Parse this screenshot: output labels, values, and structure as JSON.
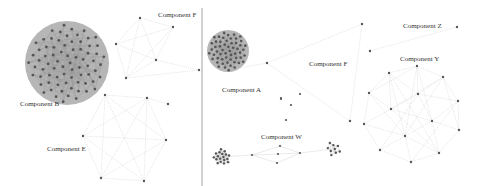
{
  "figure": {
    "width": 481,
    "height": 186,
    "divider_x": 202,
    "colors": {
      "node": "#555555",
      "edge": "#cfcfcf",
      "dense_fill": "#a9a9a9",
      "label": "#333333",
      "divider": "#8a8a8a"
    }
  },
  "panels": [
    {
      "id": "left",
      "components": [
        {
          "label": "Component B",
          "label_pos": [
            20,
            106
          ],
          "type": "dense-disk",
          "center": [
            67,
            63
          ],
          "radius": 42,
          "node_count": 75
        },
        {
          "label": "Component F",
          "label_pos": [
            158,
            17
          ],
          "type": "graph",
          "nodes": [
            [
              140,
              18
            ],
            [
              173,
              27
            ],
            [
              116,
              44
            ],
            [
              156,
              60
            ],
            [
              126,
              78
            ],
            [
              199,
              70
            ]
          ],
          "edges": [
            [
              0,
              1
            ],
            [
              0,
              2
            ],
            [
              0,
              3
            ],
            [
              0,
              4
            ],
            [
              1,
              2
            ],
            [
              1,
              3
            ],
            [
              1,
              4
            ],
            [
              2,
              3
            ],
            [
              2,
              4
            ],
            [
              3,
              4
            ],
            [
              3,
              5
            ],
            [
              4,
              5
            ]
          ]
        },
        {
          "label": "Component E",
          "label_pos": [
            47,
            149
          ],
          "type": "graph",
          "nodes": [
            [
              105,
              95
            ],
            [
              147,
              98
            ],
            [
              168,
              104
            ],
            [
              83,
              136
            ],
            [
              166,
              140
            ],
            [
              101,
              178
            ],
            [
              144,
              181
            ]
          ],
          "edges": [
            [
              0,
              1
            ],
            [
              0,
              3
            ],
            [
              0,
              4
            ],
            [
              0,
              5
            ],
            [
              0,
              6
            ],
            [
              1,
              3
            ],
            [
              1,
              4
            ],
            [
              1,
              5
            ],
            [
              1,
              6
            ],
            [
              3,
              4
            ],
            [
              3,
              5
            ],
            [
              3,
              6
            ],
            [
              4,
              5
            ],
            [
              4,
              6
            ],
            [
              5,
              6
            ],
            [
              1,
              2
            ]
          ]
        }
      ]
    },
    {
      "id": "right",
      "components": [
        {
          "label": "Component A",
          "label_pos": [
            222,
            90
          ],
          "type": "dense-disk",
          "center": [
            228,
            51
          ],
          "radius": 21,
          "node_count": 55,
          "tail_nodes": [
            [
              267,
              63
            ],
            [
              281,
              99
            ],
            [
              300,
              94
            ],
            [
              291,
              105
            ],
            [
              286,
              120
            ],
            [
              281,
              98
            ]
          ]
        },
        {
          "label": "Component F",
          "label_pos": [
            309,
            65
          ],
          "type": "graph",
          "nodes": [
            [
              267,
              63
            ],
            [
              362,
              24
            ],
            [
              350,
              121
            ]
          ],
          "edges": [
            [
              0,
              1
            ],
            [
              1,
              2
            ],
            [
              0,
              2
            ]
          ]
        },
        {
          "label": "Component Z",
          "label_pos": [
            403,
            28
          ],
          "type": "graph",
          "nodes": [
            [
              370,
              51
            ],
            [
              457,
              27
            ]
          ],
          "edges": [
            [
              0,
              1
            ]
          ]
        },
        {
          "label": "Component Y",
          "label_pos": [
            399,
            61
          ],
          "type": "graph",
          "nodes": [
            [
              417,
              66
            ],
            [
              389,
              73
            ],
            [
              443,
              77
            ],
            [
              369,
              93
            ],
            [
              458,
              101
            ],
            [
              418,
              94
            ],
            [
              391,
              109
            ],
            [
              432,
              121
            ],
            [
              364,
              124
            ],
            [
              459,
              130
            ],
            [
              405,
              136
            ],
            [
              380,
              150
            ],
            [
              439,
              153
            ],
            [
              411,
              162
            ]
          ],
          "edges": [
            [
              0,
              1
            ],
            [
              0,
              2
            ],
            [
              0,
              3
            ],
            [
              0,
              5
            ],
            [
              0,
              7
            ],
            [
              0,
              10
            ],
            [
              1,
              3
            ],
            [
              1,
              5
            ],
            [
              1,
              6
            ],
            [
              1,
              10
            ],
            [
              2,
              4
            ],
            [
              2,
              5
            ],
            [
              2,
              6
            ],
            [
              2,
              9
            ],
            [
              3,
              6
            ],
            [
              3,
              8
            ],
            [
              3,
              10
            ],
            [
              4,
              5
            ],
            [
              4,
              7
            ],
            [
              4,
              9
            ],
            [
              5,
              6
            ],
            [
              5,
              7
            ],
            [
              5,
              11
            ],
            [
              6,
              7
            ],
            [
              6,
              8
            ],
            [
              6,
              12
            ],
            [
              7,
              9
            ],
            [
              7,
              10
            ],
            [
              7,
              12
            ],
            [
              8,
              10
            ],
            [
              8,
              11
            ],
            [
              9,
              12
            ],
            [
              10,
              11
            ],
            [
              10,
              12
            ],
            [
              10,
              13
            ],
            [
              11,
              13
            ],
            [
              12,
              13
            ],
            [
              2,
              10
            ],
            [
              1,
              12
            ],
            [
              4,
              13
            ]
          ]
        },
        {
          "label": "Component W",
          "label_pos": [
            260,
            138
          ],
          "type": "chain",
          "clusters": [
            {
              "center": [
                222,
                157
              ],
              "radius": 9,
              "node_count": 18
            },
            {
              "center": [
                333,
                149
              ],
              "radius": 8,
              "node_count": 9
            }
          ],
          "nodes": [
            [
              252,
              155
            ],
            [
              280,
              146
            ],
            [
              278,
              154
            ],
            [
              277,
              163
            ],
            [
              300,
              153
            ]
          ],
          "edges": [
            [
              0,
              1
            ],
            [
              0,
              2
            ],
            [
              0,
              3
            ],
            [
              1,
              4
            ],
            [
              2,
              4
            ],
            [
              3,
              4
            ]
          ]
        }
      ]
    }
  ]
}
